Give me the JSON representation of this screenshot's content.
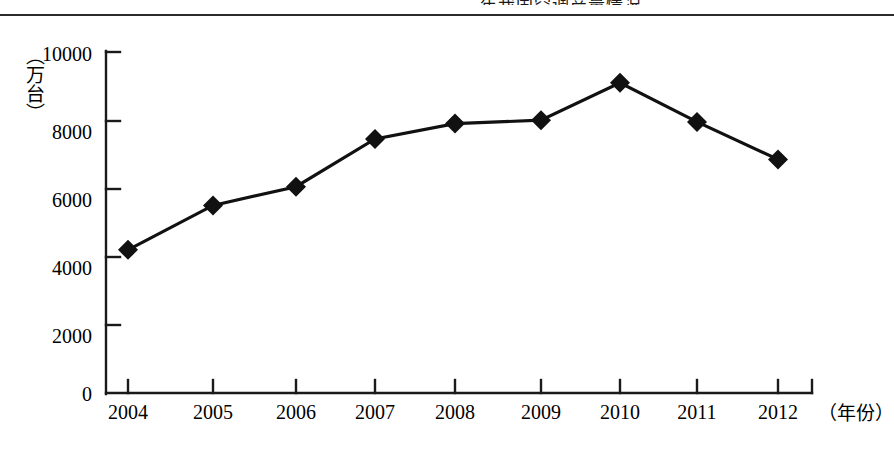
{
  "page": {
    "top_header_text": "年我国空调产量情况"
  },
  "chart_data": {
    "type": "line",
    "title": "",
    "subtitle": "",
    "xlabel": "（年份）",
    "ylabel": "（万台）",
    "categories": [
      "2004",
      "2005",
      "2006",
      "2007",
      "2008",
      "2009",
      "2010",
      "2011",
      "2012"
    ],
    "series": [
      {
        "name": "产量",
        "values": [
          4200,
          5500,
          6050,
          7450,
          7900,
          8000,
          9100,
          7950,
          6850
        ]
      }
    ],
    "ylim": [
      0,
      10000
    ],
    "y_ticks": [
      "0",
      "2000",
      "4000",
      "6000",
      "8000",
      "10000"
    ],
    "y_tick_values": [
      0,
      2000,
      4000,
      6000,
      8000,
      10000
    ],
    "grid": false,
    "legend": "none",
    "marker": "diamond",
    "line_color": "#111111",
    "marker_color": "#111111",
    "axis_color": "#1a1a1a"
  }
}
